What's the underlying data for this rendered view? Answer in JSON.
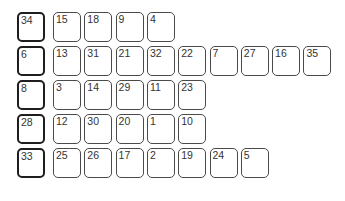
{
  "rows": [
    {
      "head": "34",
      "items": [
        "15",
        "18",
        "9",
        "4"
      ]
    },
    {
      "head": "6",
      "items": [
        "13",
        "31",
        "21",
        "32",
        "22",
        "7",
        "27",
        "16",
        "35"
      ]
    },
    {
      "head": "8",
      "items": [
        "3",
        "14",
        "29",
        "11",
        "23"
      ]
    },
    {
      "head": "28",
      "items": [
        "12",
        "30",
        "20",
        "1",
        "10"
      ]
    },
    {
      "head": "33",
      "items": [
        "25",
        "26",
        "17",
        "2",
        "19",
        "24",
        "5"
      ]
    }
  ]
}
